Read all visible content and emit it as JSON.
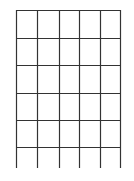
{
  "grid": {
    "columns": 5,
    "rows": 6,
    "x_lines": [
      16,
      37,
      59,
      79,
      100,
      120
    ],
    "y_lines": [
      10,
      38,
      65,
      93,
      120,
      147
    ],
    "vertical_extend_to": 168,
    "line_color": "#333333",
    "background": "#ffffff"
  }
}
